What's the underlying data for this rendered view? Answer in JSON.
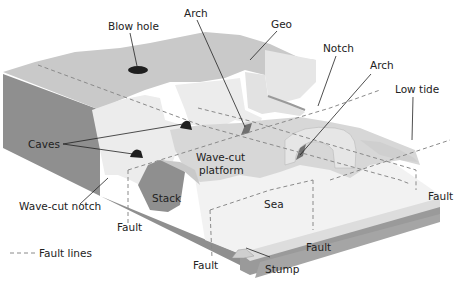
{
  "figure": {
    "type": "block diagram"
  },
  "colors": {
    "background": "#ffffff",
    "cliff_face_dark": "#8f8f8f",
    "cliff_side": "#a8a8a8",
    "clifftop": "#c9c9c9",
    "cliff_wall_light": "#ececec",
    "platform": "#d7d7d7",
    "sea": "#f1f1f1",
    "sea_edge": "#dcdcdc",
    "cave_dark": "#1e1e1e",
    "arch_shadow": "#6f6f6f",
    "fault_line": "#8a8a8a",
    "text": "#222222"
  },
  "labels": {
    "blow_hole": "Blow hole",
    "arch_top": "Arch",
    "geo": "Geo",
    "notch": "Notch",
    "arch_right": "Arch",
    "low_tide": "Low tide",
    "caves": "Caves",
    "wave_cut_platform_line1": "Wave-cut",
    "wave_cut_platform_line2": "platform",
    "wave_cut_notch": "Wave-cut notch",
    "stack": "Stack",
    "sea": "Sea",
    "fault_left": "Fault",
    "fault_middle": "Fault",
    "fault_bottom": "Fault",
    "fault_right": "Fault",
    "stump": "Stump"
  },
  "legend": {
    "fault_lines": "Fault lines"
  }
}
